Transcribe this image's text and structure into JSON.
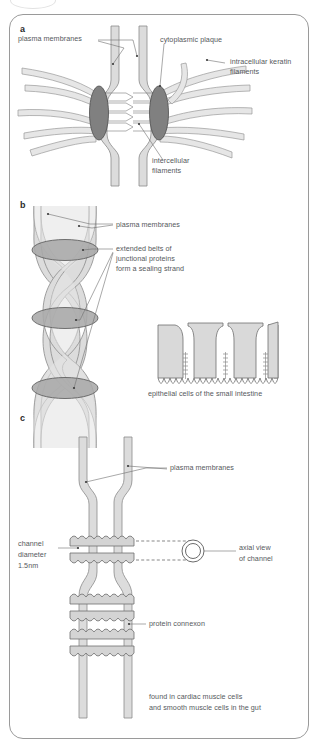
{
  "figure": {
    "panels": [
      {
        "id": "a",
        "letter": "a",
        "name": "desmosome",
        "labels": [
          {
            "key": "plasma_membranes",
            "text": "plasma membranes"
          },
          {
            "key": "cytoplasmic_plaque",
            "text": "cytoplasmic plaque"
          },
          {
            "key": "keratin_filaments_line1",
            "text": "intracellular keratin"
          },
          {
            "key": "keratin_filaments_line2",
            "text": "filaments"
          },
          {
            "key": "intercellular_line1",
            "text": "intercellular"
          },
          {
            "key": "intercellular_line2",
            "text": "filaments"
          }
        ]
      },
      {
        "id": "b",
        "letter": "b",
        "name": "tight-junction",
        "labels": [
          {
            "key": "plasma_membranes",
            "text": "plasma membranes"
          },
          {
            "key": "belts_line1",
            "text": "extended belts of"
          },
          {
            "key": "belts_line2",
            "text": "junctional proteins"
          },
          {
            "key": "belts_line3",
            "text": "form a sealing strand"
          },
          {
            "key": "epithelial_caption",
            "text": "epithelial cells of the small intestine"
          }
        ]
      },
      {
        "id": "c",
        "letter": "c",
        "name": "gap-junction",
        "labels": [
          {
            "key": "plasma_membranes",
            "text": "plasma membranes"
          },
          {
            "key": "channel_line1",
            "text": "channel"
          },
          {
            "key": "channel_line2",
            "text": "diameter"
          },
          {
            "key": "channel_line3",
            "text": "1.5nm"
          },
          {
            "key": "axial_line1",
            "text": "axial view"
          },
          {
            "key": "axial_line2",
            "text": "of channel"
          },
          {
            "key": "connexon",
            "text": "protein connexon"
          },
          {
            "key": "found_line1",
            "text": "found in cardiac muscle cells"
          },
          {
            "key": "found_line2",
            "text": "and smooth muscle cells in the gut"
          }
        ]
      }
    ],
    "colors": {
      "membrane_fill": "#dcdcdc",
      "membrane_stroke": "#8a8a8a",
      "plaque_fill": "#808080",
      "plaque_stroke": "#4d4d4d",
      "belt_fill": "#a9a9a9",
      "belt_stroke": "#555555",
      "connexon_fill": "#d4d4d4",
      "connexon_stroke": "#6e6e6e",
      "cell_fill": "#d9d9d9",
      "cell_stroke": "#6e6e6e",
      "leader_line": "#6e6e6e",
      "text": "#55595c",
      "frame": "#9a9a9a",
      "background": "#ffffff"
    }
  }
}
